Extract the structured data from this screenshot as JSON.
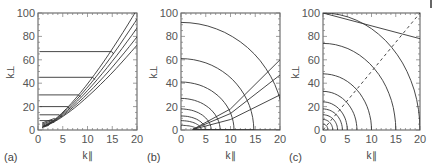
{
  "chart_data": [
    {
      "type": "contour",
      "panel": "(a)",
      "xlabel": "k∥",
      "ylabel": "k⊥",
      "xlim": [
        0,
        20
      ],
      "ylim": [
        0,
        100
      ],
      "xticks": [
        "0",
        "5",
        "10",
        "15",
        "20"
      ],
      "yticks": [
        "0",
        "20",
        "40",
        "60",
        "80",
        "100"
      ],
      "description": "Contours bunched along a rising curve from (1,3) to (20,95); horizontal plateaus at k⊥ ≈ 8, 13, 20, 30, 45, 67",
      "plateau_levels": [
        8,
        13,
        20,
        30,
        45,
        67
      ]
    },
    {
      "type": "contour",
      "panel": "(b)",
      "xlabel": "k∥",
      "ylabel": "k⊥",
      "xlim": [
        0,
        20
      ],
      "ylim": [
        0,
        100
      ],
      "xticks": [
        "0",
        "5",
        "10",
        "15",
        "20"
      ],
      "yticks": [
        "0",
        "20",
        "40",
        "60",
        "80",
        "100"
      ],
      "description": "Nested elliptical contours centred near k∥≈2.5, k⊥≈0; intercepts on k⊥ axis ≈ 4, 8, 12, 18, 27, 41, 61, 92",
      "contour_y_intercepts": [
        4,
        8,
        12,
        18,
        27,
        41,
        61,
        92
      ]
    },
    {
      "type": "contour",
      "panel": "(c)",
      "xlabel": "k∥",
      "ylabel": "k⊥",
      "xlim": [
        0,
        20
      ],
      "ylim": [
        0,
        100
      ],
      "xticks": [
        "0",
        "5",
        "10",
        "15",
        "20"
      ],
      "yticks": [
        "0",
        "20",
        "40",
        "60",
        "80",
        "100"
      ],
      "description": "Nested quarter-ellipse contours centred at origin with a dashed diagonal line k⊥ = 5 k∥",
      "contour_x_intercepts": [
        1,
        2,
        3,
        4,
        5,
        7,
        10,
        15,
        20
      ],
      "contour_y_intercepts": [
        5,
        9,
        13,
        18,
        24,
        33,
        48,
        74,
        100
      ],
      "dashed_line": {
        "from": [
          0,
          0
        ],
        "to": [
          20,
          100
        ]
      }
    }
  ],
  "labels": {
    "a": "(a)",
    "b": "(b)",
    "c": "(c)",
    "xlabel": "k∥",
    "ylabel": "k⊥"
  }
}
